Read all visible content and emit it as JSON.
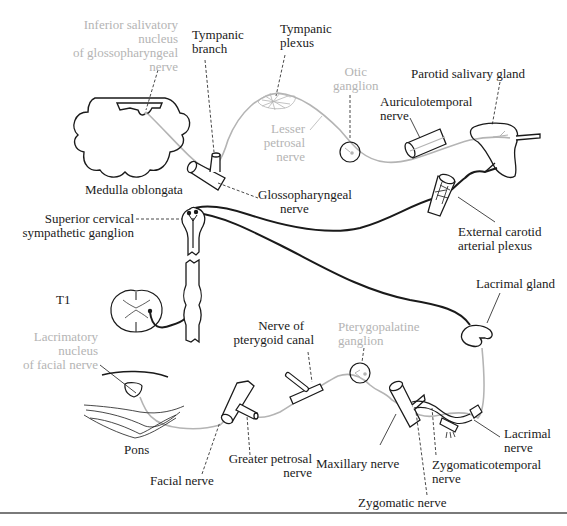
{
  "diagram": {
    "colors": {
      "sympathetic": "#1a1a1a",
      "parasympathetic": "#b4b4b4",
      "outline": "#1a1a1a",
      "background": "#ffffff",
      "rule": "#7a7a7a"
    },
    "labels": {
      "inferior_salivatory": [
        "Inferior salivatory",
        "nucleus",
        "of glossopharyngeal",
        "nerve"
      ],
      "tympanic_branch": [
        "Tympanic",
        "branch"
      ],
      "tympanic_plexus": [
        "Tympanic",
        "plexus"
      ],
      "otic_ganglion": [
        "Otic",
        "ganglion"
      ],
      "parotid_gland": [
        "Parotid salivary gland"
      ],
      "auriculotemporal": [
        "Auriculotemporal",
        "nerve"
      ],
      "lesser_petrosal": [
        "Lesser",
        "petrosal",
        "nerve"
      ],
      "medulla": [
        "Medulla oblongata"
      ],
      "glossopharyngeal": [
        "Glossopharyngeal",
        "nerve"
      ],
      "superior_cervical": [
        "Superior cervical",
        "sympathetic ganglion"
      ],
      "external_carotid": [
        "External carotid",
        "arterial plexus"
      ],
      "t1": [
        "T1"
      ],
      "lacrimal_gland": [
        "Lacrimal gland"
      ],
      "lacrimatory_nucleus": [
        "Lacrimatory",
        "nucleus",
        "of facial nerve"
      ],
      "nerve_pterygoid": [
        "Nerve of",
        "pterygoid canal"
      ],
      "pterygopalatine": [
        "Pterygopalatine",
        "ganglion"
      ],
      "pons": [
        "Pons"
      ],
      "facial_nerve": [
        "Facial nerve"
      ],
      "greater_petrosal": [
        "Greater petrosal",
        "nerve"
      ],
      "maxillary": [
        "Maxillary nerve"
      ],
      "zygomaticotemporal": [
        "Zygomaticotemporal",
        "nerve"
      ],
      "lacrimal_nerve": [
        "Lacrimal",
        "nerve"
      ],
      "zygomatic": [
        "Zygomatic nerve"
      ]
    }
  }
}
